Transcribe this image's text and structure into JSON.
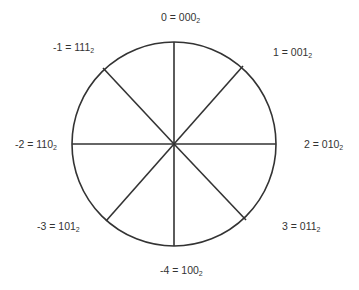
{
  "diagram": {
    "circle": {
      "cx": 174,
      "cy": 144,
      "r": 102,
      "stroke": "#333333"
    },
    "labels": [
      {
        "value": "0",
        "eq": " = ",
        "bits": "000",
        "base": "2",
        "x": 161,
        "y": 11
      },
      {
        "value": "1",
        "eq": " = ",
        "bits": "001",
        "base": "2",
        "x": 273,
        "y": 46
      },
      {
        "value": "2",
        "eq": " = ",
        "bits": "010",
        "base": "2",
        "x": 304,
        "y": 138
      },
      {
        "value": "3",
        "eq": " = ",
        "bits": "011",
        "base": "2",
        "x": 282,
        "y": 220
      },
      {
        "value": "-4",
        "eq": " = ",
        "bits": "100",
        "base": "2",
        "x": 160,
        "y": 264
      },
      {
        "value": "-3",
        "eq": " = ",
        "bits": "101",
        "base": "2",
        "x": 37,
        "y": 220
      },
      {
        "value": "-2",
        "eq": " = ",
        "bits": "110",
        "base": "2",
        "x": 15,
        "y": 138
      },
      {
        "value": "-1",
        "eq": " = ",
        "bits": "111",
        "base": "2",
        "x": 53,
        "y": 41
      }
    ]
  }
}
